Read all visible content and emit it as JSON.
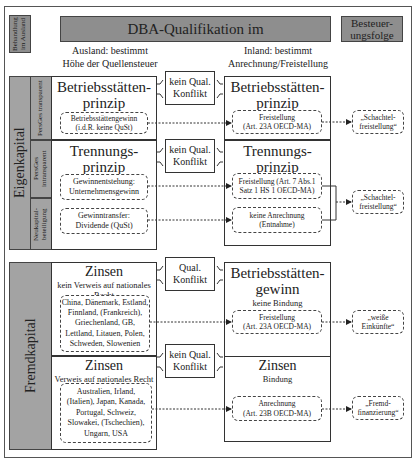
{
  "header": {
    "behandlung": "Behandlung im Ausland",
    "dba_title": "DBA-Qualifikation im",
    "besteuerung": "Besteuer-\nungsfolge",
    "ausland_note_line1": "Ausland: bestimmt",
    "ausland_note_line2": "Höhe der Quellensteuer",
    "inland_note_line1": "Inland: bestimmt",
    "inland_note_line2": "Anrechnung/Freistellung"
  },
  "eigenkapital": {
    "label": "Eigenkapital",
    "sub_labels": [
      "PersGes transparent",
      "PersGes intransparent",
      "Neukapital-beteiligung"
    ],
    "left": {
      "betriebsstaetten": {
        "title_line1": "Betriebsstätten-",
        "title_line2": "prinzip",
        "box_line1": "Betriebsstättengewinn",
        "box_line2": "(i.d.R. keine QuSt)"
      },
      "trennung": {
        "title_line1": "Trennungs-",
        "title_line2": "prinzip",
        "box1_line1": "Gewinnentstehung:",
        "box1_line2": "Unternehmensgewinn",
        "box2_line1": "Gewinntransfer:",
        "box2_line2": "Dividende (QuSt)"
      }
    },
    "conflicts": [
      {
        "line1": "kein Qual.",
        "line2": "Konflikt"
      },
      {
        "line1": "kein Qual.",
        "line2": "Konflikt"
      }
    ],
    "right": {
      "betriebsstaetten": {
        "title_line1": "Betriebsstätten-",
        "title_line2": "prinzip",
        "box_line1": "Freistellung",
        "box_line2": "(Art. 23A OECD-MA)"
      },
      "trennung": {
        "title_line1": "Trennungs-",
        "title_line2": "prinzip",
        "box1_line1": "Freistellung (Art. 7 Abs.1",
        "box1_line2": "Satz 1 HS 1 OECD-MA)",
        "box2_line1": "keine Anrechnung",
        "box2_line2": "(Entnahme)"
      }
    },
    "outcomes": [
      {
        "line1": "„Schachtel-",
        "line2": "freistellung“"
      },
      {
        "line1": "„Schachtel-",
        "line2": "freistellung“"
      }
    ]
  },
  "fremdkapital": {
    "label": "Fremdkapital",
    "left": {
      "zinsen1": {
        "title": "Zinsen",
        "sub_line1": "kein Verweis auf nationales",
        "sub_line2": "Recht",
        "countries": [
          "China, Dänemark, Estland,",
          "Finnland, (Frankreich),",
          "Griechenland, GB,",
          "Lettland, Litauen, Polen,",
          "Schweden, Slowenien"
        ]
      },
      "zinsen2": {
        "title": "Zinsen",
        "sub": "Verweis auf nationales Recht",
        "countries": [
          "Australien, Irland,",
          "(Italien), Japan, Kanada,",
          "Portugal, Schweiz,",
          "Slowakei, (Tschechien),",
          "Ungarn, USA"
        ]
      }
    },
    "conflicts": [
      {
        "line1": "Qual.",
        "line2": "Konflikt"
      },
      {
        "line1": "kein Qual.",
        "line2": "Konflikt"
      }
    ],
    "right": {
      "bs_gewinn": {
        "title_line1": "Betriebsstätten-",
        "title_line2": "gewinn",
        "sub": "keine Bindung",
        "box_line1": "Freistellung",
        "box_line2": "(Art. 23A OECD-MA)"
      },
      "zinsen": {
        "title": "Zinsen",
        "sub": "Bindung",
        "box_line1": "Anrechnung",
        "box_line2": "(Art. 23B OECD-MA)"
      }
    },
    "outcomes": [
      {
        "line1": "„weiße",
        "line2": "Einkünfte“"
      },
      {
        "line1": "„Fremd-",
        "line2": "finanzierung“"
      }
    ]
  }
}
